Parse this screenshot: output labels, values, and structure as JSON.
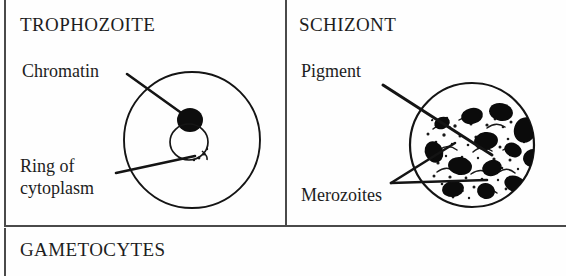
{
  "figure": {
    "caption_absent": true,
    "background_color": "#ffffff",
    "ink_color": "#111111",
    "rule_color": "#4a4a4a"
  },
  "panels": {
    "trophozoite": {
      "title": "TROPHOZOITE",
      "labels": {
        "chromatin": "Chromatin",
        "ring_line1": "Ring of",
        "ring_line2": "cytoplasm"
      },
      "drawing": {
        "name": "trophozoite-cell",
        "red_cell_outline": true,
        "chromatin_dot": "solid-black",
        "cytoplasm_ring": "thin-open-ring"
      }
    },
    "schizont": {
      "title": "SCHIZONT",
      "labels": {
        "pigment": "Pigment",
        "merozoites": "Merozoites"
      },
      "drawing": {
        "name": "schizont-cell",
        "red_cell_outline": true,
        "merozoite_count": 13,
        "pigment": "stippled-dark-mass"
      }
    },
    "gametocytes": {
      "title": "GAMETOCYTES"
    }
  }
}
